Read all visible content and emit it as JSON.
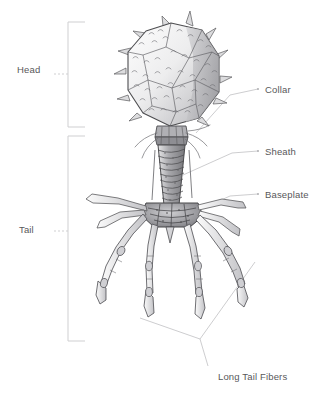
{
  "figure": {
    "background_color": "#ffffff",
    "label_color": "#58585a",
    "leader_color": "#b9b9bb",
    "drawing_ink_color": "#4a4a4c",
    "drawing_fill_light": "#f2f2f3",
    "drawing_fill_mid": "#c9c9cc",
    "drawing_fill_dark": "#9a9a9e"
  },
  "brackets": [
    {
      "name": "head-bracket",
      "label": "Head"
    },
    {
      "name": "tail-bracket",
      "label": "Tail"
    }
  ],
  "labels": {
    "head": "Head",
    "tail": "Tail",
    "collar": "Collar",
    "sheath": "Sheath",
    "baseplate": "Baseplate",
    "long_tail_fibers": "Long Tail Fibers"
  },
  "parts": [
    {
      "name": "capsid-head",
      "label": "Head"
    },
    {
      "name": "collar",
      "label": "Collar"
    },
    {
      "name": "sheath",
      "label": "Sheath"
    },
    {
      "name": "baseplate",
      "label": "Baseplate"
    },
    {
      "name": "long-tail-fibers",
      "label": "Long Tail Fibers"
    },
    {
      "name": "tail",
      "label": "Tail"
    }
  ]
}
